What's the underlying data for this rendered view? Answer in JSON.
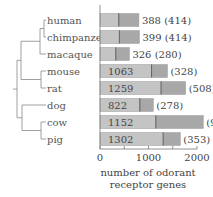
{
  "chart_data": {
    "type": "bar",
    "orientation": "horizontal",
    "stacked": true,
    "title": "",
    "xlabel": "number of odorant receptor genes",
    "ylabel": "",
    "xlim": [
      0,
      2000
    ],
    "xticks": [
      0,
      1000,
      2000
    ],
    "grid": false,
    "categories": [
      "human",
      "chimpanzee",
      "macaque",
      "mouse",
      "rat",
      "dog",
      "cow",
      "pig"
    ],
    "series": [
      {
        "name": "intact genes",
        "color": "#c4c4c4",
        "values": [
          388,
          399,
          326,
          1063,
          1259,
          822,
          1152,
          1302
        ]
      },
      {
        "name": "pseudogenes",
        "color": "#a8a8a8",
        "values": [
          414,
          414,
          280,
          328,
          508,
          278,
          977,
          353
        ]
      }
    ],
    "bar_labels": [
      "388 (414)",
      "399 (414)",
      "326 (280)",
      "1063",
      "1259",
      "822",
      "1152",
      "1302"
    ],
    "bar_labels_outside": [
      "",
      "",
      "",
      "(328)",
      "(508)",
      "(278)",
      "(977)",
      "(353)"
    ],
    "dendrogram": "((((human,chimpanzee),macaque),(mouse,rat)),(dog,(cow,pig)))"
  }
}
